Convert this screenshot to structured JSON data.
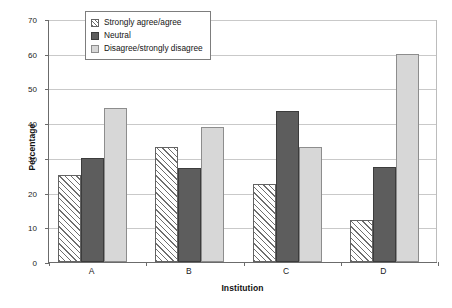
{
  "chart_data": {
    "type": "bar",
    "title": "",
    "xlabel": "Institution",
    "ylabel": "Percentage",
    "categories": [
      "A",
      "B",
      "C",
      "D"
    ],
    "series": [
      {
        "name": "Strongly agree/agree",
        "values": [
          25.0,
          33.0,
          22.5,
          12.0
        ],
        "fill": "hatched",
        "color": "#ffffff"
      },
      {
        "name": "Neutral",
        "values": [
          30.0,
          27.0,
          43.5,
          27.5
        ],
        "fill": "solid",
        "color": "#5d5d5d"
      },
      {
        "name": "Disagree/strongly disagree",
        "values": [
          44.5,
          39.0,
          33.0,
          59.8
        ],
        "fill": "solid",
        "color": "#d7d7d7"
      }
    ],
    "ylim": [
      0,
      70
    ],
    "yticks": [
      0,
      10,
      20,
      30,
      40,
      50,
      60,
      70
    ],
    "ytick_labels": [
      "0",
      "10",
      "20",
      "30",
      "40",
      "50",
      "60",
      "70"
    ],
    "grid": "horizontal",
    "legend_position": "upper-center-left",
    "legend_entries": [
      "Strongly agree/agree",
      "Neutral",
      "Disagree/strongly disagree"
    ]
  }
}
